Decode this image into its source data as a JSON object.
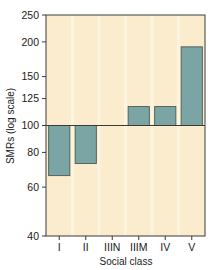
{
  "chart_data": {
    "type": "bar",
    "title": "",
    "subtitle": "",
    "xlabel": "Social class",
    "ylabel": "SMRs (log scale)",
    "categories": [
      "I",
      "II",
      "IIIN",
      "IIIM",
      "IV",
      "V"
    ],
    "values": [
      66,
      73,
      100,
      117,
      117,
      192
    ],
    "baseline": 100,
    "yscale": "log",
    "ylim": [
      40,
      250
    ],
    "yticks": [
      40,
      60,
      80,
      100,
      125,
      150,
      200,
      250
    ],
    "ytick_labels": [
      "40",
      "60",
      "80",
      "100",
      "125",
      "150",
      "200",
      "250"
    ],
    "grid": false,
    "legend": "none",
    "annotations": [],
    "colors": {
      "bar_fill": "#7ba4a4",
      "bar_edge": "#4a5b58",
      "plot_background": "#faeccd",
      "stripe": "#fdf6e3",
      "axis": "#3a3a3a",
      "text": "#1a1a1a",
      "baseline_line": "#3a3a3a"
    }
  }
}
